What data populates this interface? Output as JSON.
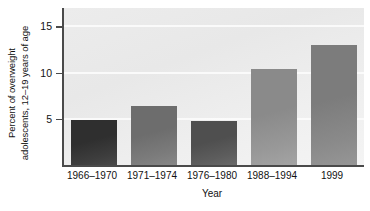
{
  "chart_data": {
    "type": "bar",
    "title": "",
    "subtitle": "",
    "xlabel": "Year",
    "ylabel_line1": "Percent of overweight",
    "ylabel_line2": "adolescents, 12–19 years of age",
    "categories": [
      "1966–1970",
      "1971–1974",
      "1976–1980",
      "1988–1994",
      "1999"
    ],
    "values": [
      4.9,
      6.4,
      4.8,
      10.4,
      13.0
    ],
    "ylim": [
      0,
      17
    ],
    "yticks": [
      5,
      10,
      15
    ],
    "ytick_labels": [
      "5",
      "10",
      "15"
    ],
    "grid": "horizontal-white-lines",
    "legend": "none",
    "bar_colors": [
      "#2f2f2f",
      "#6d6d6d",
      "#4f4f4f",
      "#8a8a8a",
      "#7c7c7c"
    ],
    "plot_background": "#ebebeb",
    "axis_color": "#4a4a4a",
    "annotations": []
  }
}
